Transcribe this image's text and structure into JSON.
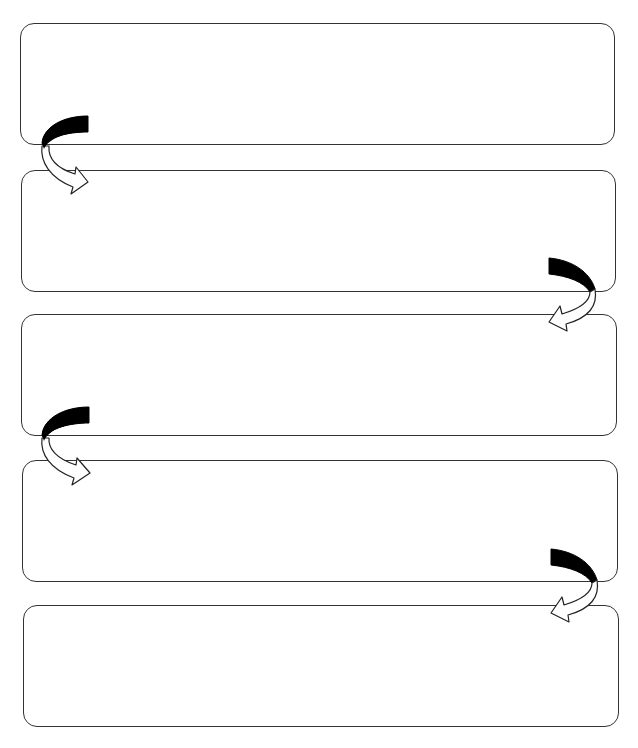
{
  "diagram": {
    "type": "sequence-flowchart",
    "boxes": [
      {
        "id": 1,
        "text": ""
      },
      {
        "id": 2,
        "text": ""
      },
      {
        "id": 3,
        "text": ""
      },
      {
        "id": 4,
        "text": ""
      },
      {
        "id": 5,
        "text": ""
      }
    ],
    "connectors": [
      {
        "from": 1,
        "to": 2,
        "side": "left"
      },
      {
        "from": 2,
        "to": 3,
        "side": "right"
      },
      {
        "from": 3,
        "to": 4,
        "side": "left"
      },
      {
        "from": 4,
        "to": 5,
        "side": "right"
      }
    ],
    "colors": {
      "stroke": "#333333",
      "arrow_fill": "#000000",
      "background": "#ffffff"
    }
  }
}
